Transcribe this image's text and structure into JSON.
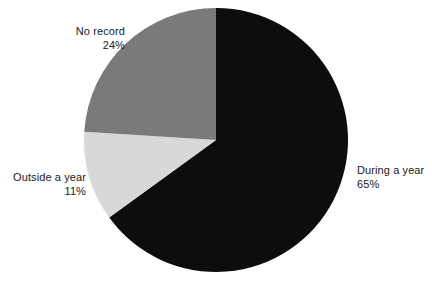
{
  "chart_data": {
    "type": "pie",
    "title": "",
    "subtitle": "",
    "xlabel": "",
    "ylabel": "",
    "legend_position": "none",
    "grid": false,
    "units": "percent",
    "categories": [
      "During a year",
      "Outside a year",
      "No record"
    ],
    "values": [
      65,
      11,
      24
    ],
    "slices": [
      {
        "label": "During a year",
        "value": 65,
        "value_text": "65%",
        "color": "#0d0d0d",
        "start_angle_deg": 0,
        "end_angle_deg": 234,
        "label_align": "left"
      },
      {
        "label": "Outside a year",
        "value": 11,
        "value_text": "11%",
        "color": "#d8d8d8",
        "start_angle_deg": 234,
        "end_angle_deg": 273.6,
        "label_align": "right"
      },
      {
        "label": "No record",
        "value": 24,
        "value_text": "24%",
        "color": "#7a7a7a",
        "start_angle_deg": 273.6,
        "end_angle_deg": 360,
        "label_align": "right"
      }
    ],
    "geometry": {
      "center_x": 216,
      "center_y": 140,
      "radius": 132,
      "start_angle_deg": 0,
      "direction": "clockwise"
    },
    "background_color": "#ffffff",
    "label_text_color": "#1a1a1a"
  },
  "labels": {
    "no_record": {
      "name": "No record",
      "value": "24%"
    },
    "outside_year": {
      "name": "Outside a year",
      "value": "11%"
    },
    "during_year": {
      "name": "During a year",
      "value": "65%"
    }
  }
}
